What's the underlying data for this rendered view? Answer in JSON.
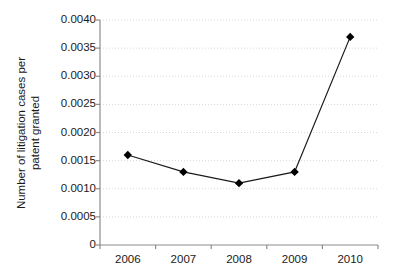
{
  "chart_data": {
    "type": "line",
    "title": "",
    "xlabel": "",
    "ylabel": "Number of litigation cases per patent granted",
    "ylabel_line1": "Number of litigation cases per",
    "ylabel_line2": "patent granted",
    "categories": [
      "2006",
      "2007",
      "2008",
      "2009",
      "2010"
    ],
    "values": [
      0.0016,
      0.0013,
      0.0011,
      0.0013,
      0.0037
    ],
    "series": [
      {
        "name": "Number of litigation cases per patent granted",
        "values": [
          0.0016,
          0.0013,
          0.0011,
          0.0013,
          0.0037
        ]
      }
    ],
    "ylim": [
      0,
      0.004
    ],
    "xlim": [
      "2006",
      "2010"
    ],
    "ytick_labels": [
      "0",
      "0.0005",
      "0.0010",
      "0.0015",
      "0.0020",
      "0.0025",
      "0.0030",
      "0.0035",
      "0.0040"
    ],
    "ytick_values": [
      0,
      0.0005,
      0.001,
      0.0015,
      0.002,
      0.0025,
      0.003,
      0.0035,
      0.004
    ],
    "xtick_labels": [
      "2006",
      "2007",
      "2008",
      "2009",
      "2010"
    ],
    "grid": "horizontal-dotted",
    "legend": "none",
    "marker": "filled-diamond",
    "line_color": "#1a1a1a",
    "marker_color": "#000000",
    "grid_color": "#d8d8d8",
    "axis_color": "#8c8c8c",
    "background": "#ffffff"
  }
}
